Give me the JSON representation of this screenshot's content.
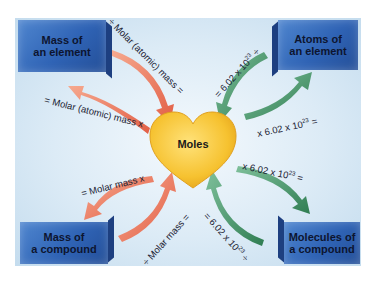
{
  "diagram": {
    "center": {
      "label": "Moles",
      "shape": "heart",
      "color": "#f5c232"
    },
    "boxes": [
      {
        "id": "mass-element",
        "label_line1": "Mass of",
        "label_line2": "an element"
      },
      {
        "id": "atoms-element",
        "label_line1": "Atoms of",
        "label_line2": "an element"
      },
      {
        "id": "mass-compound",
        "label_line1": "Mass of",
        "label_line2": "a compound"
      },
      {
        "id": "molecules-compound",
        "label_line1": "Molecules of",
        "label_line2": "a compound"
      }
    ],
    "arrows": {
      "tl_in": {
        "text": "÷ Molar (atomic) mass =",
        "color": "#e8735a"
      },
      "tl_out": {
        "text": "= Molar (atomic) mass x",
        "color": "#e8735a"
      },
      "tr_in": {
        "text_pre": "= 6.02 x 10",
        "exp": "23",
        "text_post": " ÷",
        "color": "#3a8a5e"
      },
      "tr_out": {
        "text_pre": "x 6.02 x 10",
        "exp": "23",
        "text_post": " =",
        "color": "#3a8a5e"
      },
      "bl_out": {
        "text": "= Molar mass x",
        "color": "#e8735a"
      },
      "bl_in": {
        "text": "÷ Molar mass =",
        "color": "#e8735a"
      },
      "br_out": {
        "text_pre": "x 6.02 x 10",
        "exp": "23",
        "text_post": " =",
        "color": "#3a8a5e"
      },
      "br_in": {
        "text_pre": "= 6.02 x 10",
        "exp": "23",
        "text_post": " ÷",
        "color": "#3a8a5e"
      }
    },
    "colors": {
      "box": "#2f63b5",
      "background": "#dcebf6",
      "red_arrow": "#e8735a",
      "green_arrow": "#3a8a5e"
    }
  }
}
